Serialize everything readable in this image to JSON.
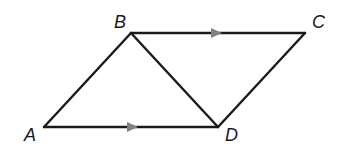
{
  "diagram": {
    "colors": {
      "line": "#1a1a1a",
      "arrow": "#808080",
      "background": "#ffffff"
    },
    "vertices": [
      {
        "id": "A",
        "label": "A",
        "x": 44,
        "y": 127,
        "label_x": 24,
        "label_y": 141
      },
      {
        "id": "B",
        "label": "B",
        "x": 131,
        "y": 33,
        "label_x": 114,
        "label_y": 28
      },
      {
        "id": "C",
        "label": "C",
        "x": 305,
        "y": 33,
        "label_x": 312,
        "label_y": 28
      },
      {
        "id": "D",
        "label": "D",
        "x": 218,
        "y": 127,
        "label_x": 225,
        "label_y": 141
      }
    ],
    "segments": [
      {
        "from": "A",
        "to": "B"
      },
      {
        "from": "B",
        "to": "C",
        "parallel_mark": true
      },
      {
        "from": "C",
        "to": "D"
      },
      {
        "from": "A",
        "to": "D",
        "parallel_mark": true
      },
      {
        "from": "B",
        "to": "D",
        "diagonal": true
      }
    ],
    "parallel_marks": [
      {
        "segment": "BC",
        "x": 217,
        "y": 33,
        "direction": "right"
      },
      {
        "segment": "AD",
        "x": 131,
        "y": 127,
        "direction": "right"
      }
    ]
  }
}
